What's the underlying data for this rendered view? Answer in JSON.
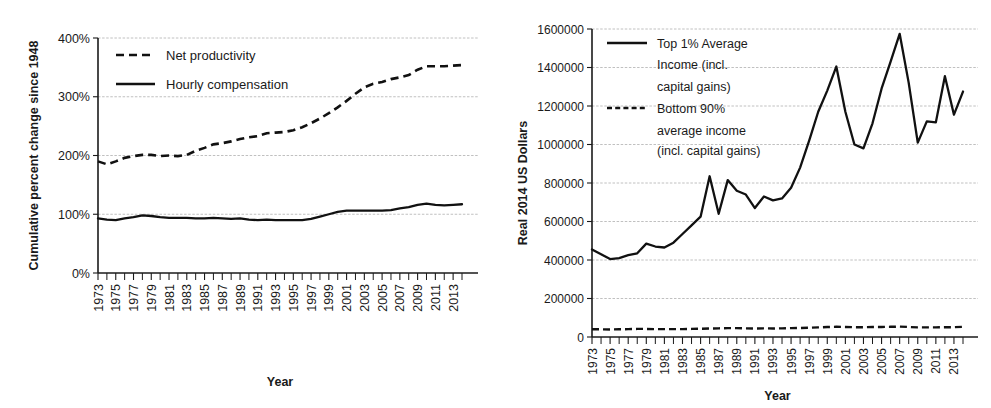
{
  "figure": {
    "panels": [
      "productivity-pay-gap",
      "top-1-percent-income"
    ]
  },
  "chart_data": [
    {
      "id": "left",
      "type": "line",
      "title": "",
      "xlabel": "Year",
      "ylabel": "Cumulative percent change since 1948",
      "xlim": [
        1973,
        2014
      ],
      "ylim": [
        0,
        400
      ],
      "grid": true,
      "legend_position": "top-left",
      "ytick_labels": [
        "400%",
        "300%",
        "200%",
        "100%",
        "0%"
      ],
      "ytick_values": [
        400,
        300,
        200,
        100,
        0
      ],
      "xtick_labels": [
        "1973",
        "1975",
        "1977",
        "1979",
        "1981",
        "1983",
        "1985",
        "1987",
        "1989",
        "1991",
        "1993",
        "1995",
        "1997",
        "1999",
        "2001",
        "2003",
        "2005",
        "2007",
        "2009",
        "2011",
        "2013"
      ],
      "xtick_values": [
        1973,
        1975,
        1977,
        1979,
        1981,
        1983,
        1985,
        1987,
        1989,
        1991,
        1993,
        1995,
        1997,
        1999,
        2001,
        2003,
        2005,
        2007,
        2009,
        2011,
        2013
      ],
      "x": [
        1973,
        1974,
        1975,
        1976,
        1977,
        1978,
        1979,
        1980,
        1981,
        1982,
        1983,
        1984,
        1985,
        1986,
        1987,
        1988,
        1989,
        1990,
        1991,
        1992,
        1993,
        1994,
        1995,
        1996,
        1997,
        1998,
        1999,
        2000,
        2001,
        2002,
        2003,
        2004,
        2005,
        2006,
        2007,
        2008,
        2009,
        2010,
        2011,
        2012,
        2013,
        2014
      ],
      "series": [
        {
          "name": "Net productivity",
          "style": "dashed",
          "values": [
            190,
            185,
            190,
            196,
            199,
            201,
            201,
            199,
            200,
            199,
            201,
            208,
            213,
            219,
            221,
            224,
            228,
            231,
            233,
            238,
            239,
            240,
            243,
            248,
            255,
            263,
            272,
            282,
            293,
            305,
            316,
            322,
            325,
            330,
            333,
            337,
            346,
            352,
            352,
            352,
            353,
            354
          ]
        },
        {
          "name": "Hourly compensation",
          "style": "solid",
          "values": [
            93,
            91,
            90,
            93,
            95,
            98,
            97,
            95,
            94,
            94,
            94,
            93,
            93,
            94,
            93,
            92,
            93,
            91,
            90,
            91,
            90,
            90,
            90,
            90,
            92,
            96,
            100,
            104,
            106,
            106,
            106,
            106,
            106,
            107,
            110,
            112,
            116,
            118,
            116,
            115,
            116,
            117
          ]
        }
      ]
    },
    {
      "id": "right",
      "type": "line",
      "title": "",
      "xlabel": "Year",
      "ylabel": "Real 2014 US Dollars",
      "xlim": [
        1973,
        2014
      ],
      "ylim": [
        0,
        1600000
      ],
      "grid": true,
      "legend_position": "top-left",
      "ytick_labels": [
        "1600000",
        "1400000",
        "1200000",
        "1000000",
        "800000",
        "600000",
        "400000",
        "200000",
        "0"
      ],
      "ytick_values": [
        1600000,
        1400000,
        1200000,
        1000000,
        800000,
        600000,
        400000,
        200000,
        0
      ],
      "xtick_labels": [
        "1973",
        "1975",
        "1977",
        "1979",
        "1981",
        "1983",
        "1985",
        "1987",
        "1989",
        "1991",
        "1993",
        "1995",
        "1997",
        "1999",
        "2001",
        "2003",
        "2005",
        "2007",
        "2009",
        "2011",
        "2013"
      ],
      "xtick_values": [
        1973,
        1975,
        1977,
        1979,
        1981,
        1983,
        1985,
        1987,
        1989,
        1991,
        1993,
        1995,
        1997,
        1999,
        2001,
        2003,
        2005,
        2007,
        2009,
        2011,
        2013
      ],
      "x": [
        1973,
        1974,
        1975,
        1976,
        1977,
        1978,
        1979,
        1980,
        1981,
        1982,
        1983,
        1984,
        1985,
        1986,
        1987,
        1988,
        1989,
        1990,
        1991,
        1992,
        1993,
        1994,
        1995,
        1996,
        1997,
        1998,
        1999,
        2000,
        2001,
        2002,
        2003,
        2004,
        2005,
        2006,
        2007,
        2008,
        2009,
        2010,
        2011,
        2012,
        2013,
        2014
      ],
      "series": [
        {
          "name": "Top 1% Average Income (incl. capital gains)",
          "style": "solid",
          "values": [
            455000,
            430000,
            405000,
            410000,
            425000,
            435000,
            485000,
            470000,
            465000,
            490000,
            535000,
            580000,
            625000,
            835000,
            640000,
            815000,
            760000,
            740000,
            670000,
            730000,
            710000,
            720000,
            775000,
            880000,
            1020000,
            1170000,
            1280000,
            1405000,
            1170000,
            1000000,
            980000,
            1110000,
            1290000,
            1430000,
            1575000,
            1320000,
            1010000,
            1120000,
            1115000,
            1355000,
            1155000,
            1275000
          ]
        },
        {
          "name": "Bottom 90% average income (incl. capital gains)",
          "style": "dashed",
          "values": [
            40000,
            40000,
            39000,
            40000,
            41000,
            42000,
            42000,
            41000,
            41000,
            41000,
            41000,
            42000,
            43000,
            44000,
            45000,
            46000,
            46000,
            45000,
            44000,
            45000,
            44000,
            45000,
            46000,
            47000,
            48000,
            50000,
            52000,
            53000,
            52000,
            51000,
            51000,
            52000,
            52000,
            53000,
            54000,
            52000,
            50000,
            50000,
            50000,
            51000,
            51000,
            53000
          ]
        }
      ]
    }
  ]
}
